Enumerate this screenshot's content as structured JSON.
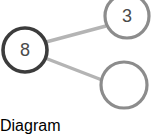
{
  "canvas": {
    "width": 157,
    "height": 117,
    "background": "#ffffff"
  },
  "diagram": {
    "type": "node-link-graph",
    "title": "",
    "colors": {
      "root_node_stroke": "#3c3c3c",
      "leaf_node_stroke": "#8c8c8c",
      "edge_stroke": "#b4b4b4",
      "node_fill": "#ffffff",
      "label_color": "#4a4a4a"
    },
    "nodes": [
      {
        "id": "root",
        "label": "8",
        "cx": 25,
        "cy": 50,
        "r": 22,
        "stroke": "#3c3c3c",
        "stroke_width": 3.6,
        "fill": "#ffffff",
        "label_size": 18
      },
      {
        "id": "child-top",
        "label": "3",
        "cx": 127,
        "cy": 16,
        "r": 22,
        "stroke": "#8c8c8c",
        "stroke_width": 3.2,
        "fill": "#ffffff",
        "label_size": 18
      },
      {
        "id": "child-bottom",
        "label": "",
        "cx": 124,
        "cy": 85,
        "r": 23,
        "stroke": "#8c8c8c",
        "stroke_width": 3.2,
        "fill": "#ffffff",
        "label_size": 18
      }
    ],
    "edges": [
      {
        "id": "edge-root-top",
        "from": "root",
        "to": "child-top",
        "x1": 46,
        "y1": 42,
        "x2": 106,
        "y2": 26,
        "stroke": "#b4b4b4",
        "stroke_width": 3.4
      },
      {
        "id": "edge-root-bottom",
        "from": "root",
        "to": "child-bottom",
        "x1": 45,
        "y1": 58,
        "x2": 102,
        "y2": 80,
        "stroke": "#b4b4b4",
        "stroke_width": 3.4
      }
    ]
  }
}
